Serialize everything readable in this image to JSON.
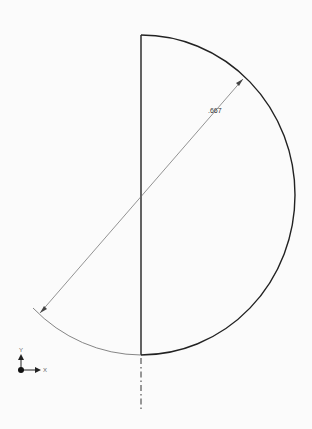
{
  "viewport": {
    "background": "#fbfbfb"
  },
  "sketch": {
    "profile_color": "#222222",
    "construction_color": "#777777",
    "centerline_color": "#333333"
  },
  "dimension": {
    "label": ".667",
    "type": "diameter",
    "color": "#666666"
  },
  "triad": {
    "x_label": "X",
    "y_label": "Y",
    "color": "#222222"
  }
}
